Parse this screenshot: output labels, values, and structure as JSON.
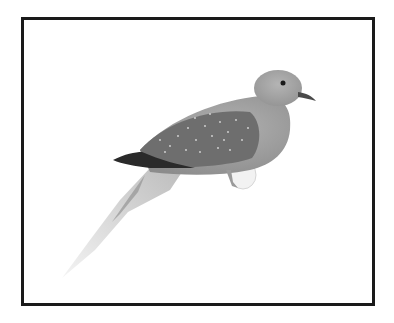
{
  "image": {
    "subject": "bird",
    "description": "Grayscale photo of a dove perched on a small white perch, framed with a thick black border",
    "colors": {
      "background": "#ffffff",
      "frame": "#1a1a1a",
      "body": "#9a9a9a",
      "wing": "#6e6e6e",
      "wingtip": "#2a2a2a",
      "head": "#a8a8a8",
      "tail": "#d0d0d0",
      "perch": "#f2f2f2"
    }
  }
}
